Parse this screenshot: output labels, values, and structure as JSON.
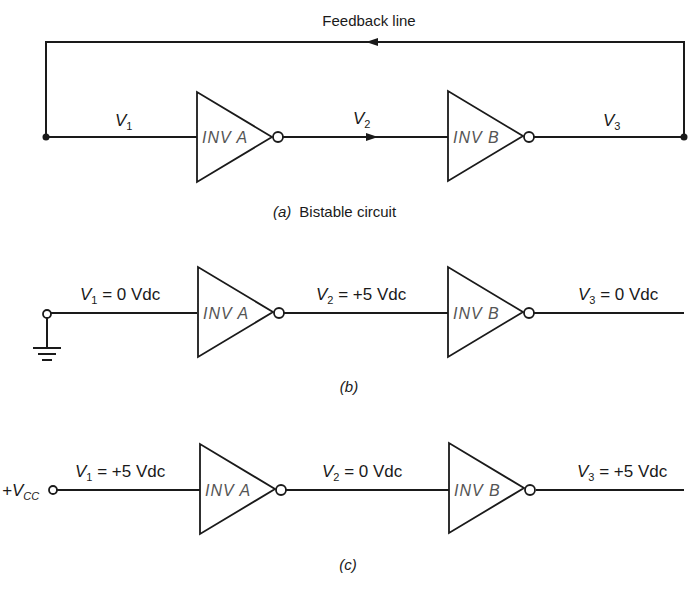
{
  "diagram": {
    "colors": {
      "line": "#1a1a1a",
      "gate_text": "#555555",
      "background": "#ffffff"
    },
    "panel_a": {
      "feedback_label": "Feedback line",
      "v1": {
        "sym": "V",
        "sub": "1"
      },
      "v2": {
        "sym": "V",
        "sub": "2"
      },
      "v3": {
        "sym": "V",
        "sub": "3"
      },
      "gate_a": "INV A",
      "gate_b": "INV B",
      "caption_letter": "(a)",
      "caption_text": "Bistable circuit"
    },
    "panel_b": {
      "v1": {
        "sym": "V",
        "sub": "1",
        "value": " = 0 Vdc"
      },
      "v2": {
        "sym": "V",
        "sub": "2",
        "value": " = +5 Vdc"
      },
      "v3": {
        "sym": "V",
        "sub": "3",
        "value": " = 0 Vdc"
      },
      "gate_a": "INV A",
      "gate_b": "INV B",
      "input_source": "ground-icon",
      "caption_letter": "(b)"
    },
    "panel_c": {
      "source_label": {
        "prefix": "+V",
        "sub": "CC"
      },
      "v1": {
        "sym": "V",
        "sub": "1",
        "value": " = +5 Vdc"
      },
      "v2": {
        "sym": "V",
        "sub": "2",
        "value": " = 0 Vdc"
      },
      "v3": {
        "sym": "V",
        "sub": "3",
        "value": " = +5 Vdc"
      },
      "gate_a": "INV A",
      "gate_b": "INV B",
      "caption_letter": "(c)"
    }
  }
}
